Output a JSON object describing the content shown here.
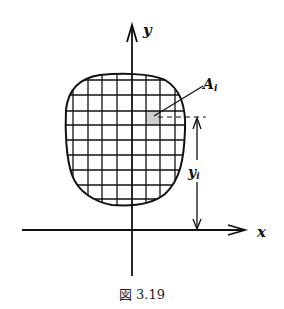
{
  "figure": {
    "caption": "図 3.19",
    "labels": {
      "y_axis": "y",
      "x_axis": "x",
      "element_area": "A",
      "element_area_sub": "i",
      "distance": "y",
      "distance_sub": "i"
    }
  }
}
